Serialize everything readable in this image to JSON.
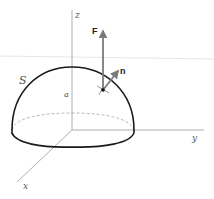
{
  "figure": {
    "labels": {
      "z_axis": "z",
      "y_axis": "y",
      "x_axis": "x",
      "surface": "S",
      "radius": "a",
      "field_vector": "F",
      "normal_vector": "n"
    },
    "colors": {
      "surface_outline": "#1a1a1a",
      "axes": "#9a9a9a",
      "hidden_edge": "#aaaaaa",
      "vectors": "#7a7a7a",
      "point": "#111111"
    }
  }
}
